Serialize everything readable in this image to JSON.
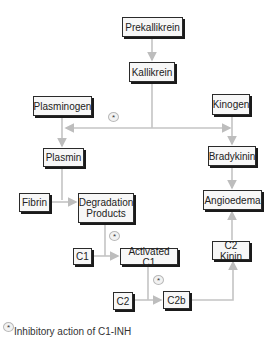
{
  "diagram": {
    "nodes": [
      {
        "id": "prekallikrein",
        "label": "Prekallikrein",
        "x": 122,
        "y": 17,
        "w": 61,
        "h": 20
      },
      {
        "id": "kallikrein",
        "label": "Kallikrein",
        "x": 129,
        "y": 62,
        "w": 46,
        "h": 20
      },
      {
        "id": "plasminogen",
        "label": "Plasminogen",
        "x": 33,
        "y": 96,
        "w": 59,
        "h": 20
      },
      {
        "id": "kinogen",
        "label": "Kinogen",
        "x": 212,
        "y": 94,
        "w": 38,
        "h": 21
      },
      {
        "id": "plasmin",
        "label": "Plasmin",
        "x": 43,
        "y": 148,
        "w": 41,
        "h": 19
      },
      {
        "id": "bradykinin",
        "label": "Bradykinin",
        "x": 208,
        "y": 146,
        "w": 48,
        "h": 20
      },
      {
        "id": "fibrin",
        "label": "Fibrin",
        "x": 19,
        "y": 193,
        "w": 31,
        "h": 19
      },
      {
        "id": "degradation",
        "label": "Degradation\nProducts",
        "x": 78,
        "y": 193,
        "w": 56,
        "h": 30
      },
      {
        "id": "angioedema",
        "label": "Angioedema",
        "x": 203,
        "y": 190,
        "w": 59,
        "h": 20
      },
      {
        "id": "c1",
        "label": "C1",
        "x": 73,
        "y": 248,
        "w": 19,
        "h": 17
      },
      {
        "id": "activated_c1",
        "label": "Activated C1",
        "x": 120,
        "y": 248,
        "w": 58,
        "h": 17
      },
      {
        "id": "c2kinin",
        "label": "C2 Kinin",
        "x": 212,
        "y": 241,
        "w": 38,
        "h": 19
      },
      {
        "id": "c2",
        "label": "C2",
        "x": 113,
        "y": 292,
        "w": 20,
        "h": 18
      },
      {
        "id": "c2b",
        "label": "C2b",
        "x": 163,
        "y": 291,
        "w": 27,
        "h": 18
      }
    ],
    "inhibition_markers": [
      {
        "id": "star-kallikrein",
        "x": 108,
        "y": 112,
        "symbol": "*"
      },
      {
        "id": "star-degradation",
        "x": 109,
        "y": 231,
        "symbol": "*"
      },
      {
        "id": "star-activated",
        "x": 153,
        "y": 275,
        "symbol": "*"
      }
    ],
    "edges": [
      {
        "from": "prekallikrein",
        "to": "kallikrein"
      },
      {
        "from": "kallikrein",
        "to": "plasminogen-plasmin-line"
      },
      {
        "from": "kallikrein",
        "to": "kinogen-bradykinin-line"
      },
      {
        "from": "plasminogen",
        "to": "plasmin"
      },
      {
        "from": "kinogen",
        "to": "bradykinin"
      },
      {
        "from": "plasmin",
        "to": "degradation"
      },
      {
        "from": "fibrin",
        "to": "degradation"
      },
      {
        "from": "bradykinin",
        "to": "angioedema"
      },
      {
        "from": "degradation",
        "to": "activated_c1"
      },
      {
        "from": "c1",
        "to": "activated_c1"
      },
      {
        "from": "activated_c1",
        "to": "c2b"
      },
      {
        "from": "c2",
        "to": "c2b"
      },
      {
        "from": "c2b",
        "to": "c2kinin"
      },
      {
        "from": "c2kinin",
        "to": "angioedema"
      }
    ],
    "legend": {
      "symbol": "*",
      "text": "Inhibitory action of C1-INH"
    }
  }
}
